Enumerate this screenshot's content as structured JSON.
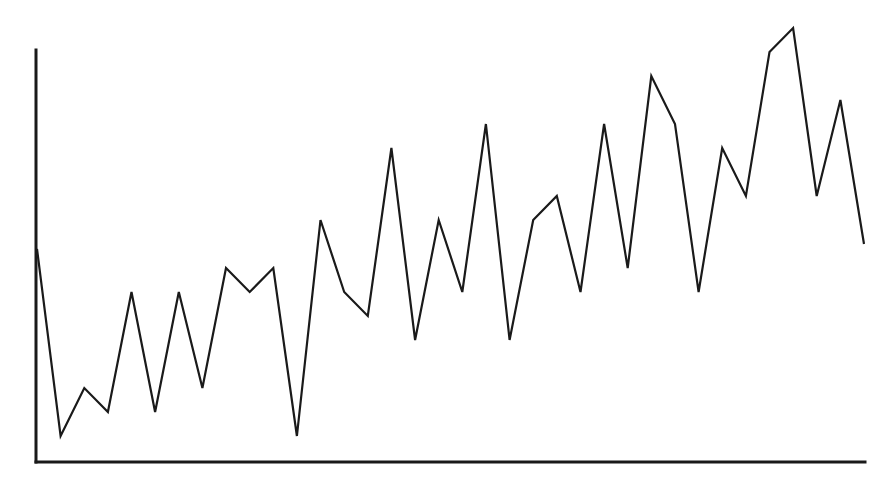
{
  "chart_data": {
    "type": "line",
    "title": "",
    "xlabel": "",
    "ylabel": "",
    "grid": false,
    "legend": null,
    "x": [
      1,
      2,
      3,
      4,
      5,
      6,
      7,
      8,
      9,
      10,
      11,
      12,
      13,
      14,
      15,
      16,
      17,
      18,
      19,
      20,
      21,
      22,
      23,
      24,
      25,
      26,
      27,
      28,
      29,
      30,
      31,
      32,
      33,
      34,
      35,
      36
    ],
    "values": [
      8.8,
      1,
      3,
      2,
      7,
      2,
      7,
      3,
      8,
      7,
      8,
      1,
      10,
      7,
      6,
      13,
      5,
      10,
      7,
      14,
      5,
      10,
      11,
      7,
      14,
      8,
      16,
      14,
      7,
      13,
      11,
      17,
      18,
      11,
      15,
      9
    ],
    "ylim": [
      0,
      18
    ],
    "xlim": [
      1,
      36
    ],
    "line_color": "#1a1a1a",
    "axis_color": "#1a1a1a"
  },
  "plot": {
    "left": 37,
    "right": 864,
    "top": 50,
    "baseline": 462,
    "unit_px": 24,
    "y_axis_top": 50
  }
}
